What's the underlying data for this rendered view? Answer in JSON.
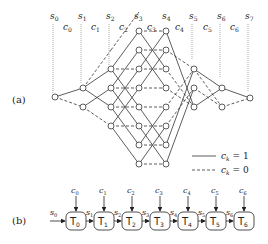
{
  "figure": {
    "panel_a": {
      "label": "(a)",
      "state_labels": [
        "s0",
        "s1",
        "s2",
        "s3",
        "s4",
        "s5",
        "s6",
        "s7"
      ],
      "input_labels": [
        "c0",
        "c1",
        "c2",
        "c3",
        "c4",
        "c5",
        "c6"
      ],
      "legend": [
        {
          "style": "solid",
          "text": "c_k = 1"
        },
        {
          "style": "dashed",
          "text": "c_k = 0"
        }
      ]
    },
    "panel_b": {
      "label": "(b)",
      "blocks": [
        "T0",
        "T1",
        "T2",
        "T3",
        "T4",
        "T5",
        "T6"
      ],
      "inputs": [
        "c0",
        "c1",
        "c2",
        "c3",
        "c4",
        "c5",
        "c6"
      ],
      "states": [
        "s0",
        "s1",
        "s2",
        "s3",
        "s4",
        "s5",
        "s6"
      ]
    }
  }
}
